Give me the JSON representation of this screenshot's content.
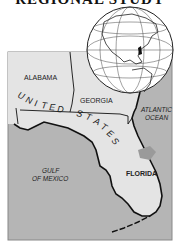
{
  "title": "REGIONAL STUDY",
  "map": {
    "labels": {
      "alabama": "ALABAMA",
      "georgia": "GEORGIA",
      "united_states": [
        "U",
        "N",
        "I",
        "T",
        "E",
        "D",
        "S",
        "T",
        "A",
        "T",
        "E",
        "S"
      ],
      "atlantic_line1": "ATLANTIC",
      "atlantic_line2": "OCEAN",
      "gulf_line1": "GULF",
      "gulf_line2": "OF MEXICO",
      "florida": "FLORIDA"
    },
    "colors": {
      "land": "#e4e4e4",
      "water": "#b5b5b5",
      "highlight": "#9a9a9a",
      "border": "#111111",
      "globe": "#ffffff"
    },
    "inset": {
      "type": "globe",
      "highlighted_region": "Florida"
    }
  }
}
